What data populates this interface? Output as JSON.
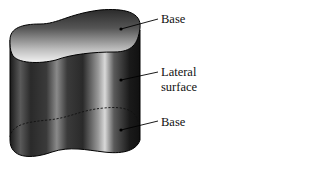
{
  "figure": {
    "colors": {
      "body_dark": "#1a1a1a",
      "body_highlight": "#d9d9d9",
      "top_dark": "#2b2b2b",
      "top_light": "#f2f2f2",
      "outline": "#000000"
    }
  },
  "labels": {
    "top_base": "Base",
    "lateral_line1": "Lateral",
    "lateral_line2": "surface",
    "bottom_base": "Base"
  }
}
